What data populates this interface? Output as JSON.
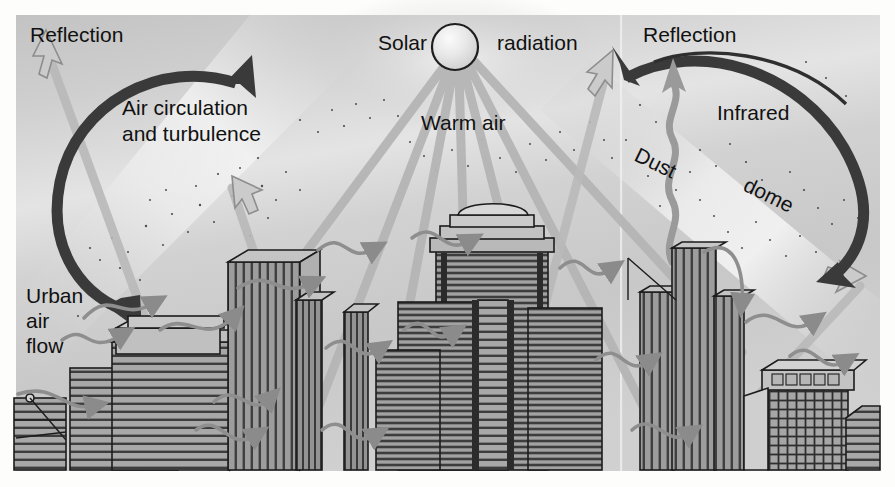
{
  "figure": {
    "background": {
      "panel_fill": "#c9c9c9",
      "panel_highlight": "#e8e8e8",
      "page_fill": "#fdfdfb",
      "panel_x": 16,
      "panel_y": 15,
      "panel_w": 864,
      "panel_h": 456
    },
    "palette": {
      "dark_arrow": "#3a3a3a",
      "mid_gray": "#8e8e8e",
      "light_arrow": "#b4b4b4",
      "building_fill": "#9a9a9a",
      "building_fill_dark": "#7e7e7e",
      "building_fill_light": "#bdbdbd",
      "outline": "#1c1c1c",
      "text": "#111111",
      "sun_fill": "#e9e9e9",
      "seam": "#f2f2f2"
    }
  },
  "labels": [
    {
      "id": "reflection-left",
      "text": "Reflection",
      "x": 30,
      "y": 42,
      "size": 22,
      "rotate": 0
    },
    {
      "id": "air-circulation-1",
      "text": "Air circulation",
      "x": 122,
      "y": 115,
      "size": 21,
      "rotate": 0
    },
    {
      "id": "air-circulation-2",
      "text": "and turbulence",
      "x": 122,
      "y": 141,
      "size": 21,
      "rotate": 0
    },
    {
      "id": "solar",
      "text": "Solar",
      "x": 378,
      "y": 50,
      "size": 21,
      "rotate": 0
    },
    {
      "id": "radiation",
      "text": "radiation",
      "x": 497,
      "y": 50,
      "size": 21,
      "rotate": 0
    },
    {
      "id": "warm-air",
      "text": "Warm air",
      "x": 421,
      "y": 130,
      "size": 21,
      "rotate": 0
    },
    {
      "id": "reflection-right",
      "text": "Reflection",
      "x": 643,
      "y": 42,
      "size": 22,
      "rotate": 0
    },
    {
      "id": "infrared",
      "text": "Infrared",
      "x": 717,
      "y": 120,
      "size": 21,
      "rotate": 0
    },
    {
      "id": "dust",
      "text": "Dust",
      "x": 633,
      "y": 160,
      "size": 21,
      "rotate": 26
    },
    {
      "id": "dome",
      "text": "dome",
      "x": 742,
      "y": 190,
      "size": 21,
      "rotate": 26
    },
    {
      "id": "urban-1",
      "text": "Urban",
      "x": 26,
      "y": 303,
      "size": 21,
      "rotate": 0
    },
    {
      "id": "urban-2",
      "text": "air",
      "x": 26,
      "y": 328,
      "size": 21,
      "rotate": 0
    },
    {
      "id": "urban-3",
      "text": "flow",
      "x": 26,
      "y": 353,
      "size": 21,
      "rotate": 0
    }
  ],
  "sun": {
    "cx": 455,
    "cy": 47,
    "r": 23,
    "ray_count": 7
  },
  "circulation_arrows": [
    {
      "id": "left-circulation",
      "side": "left",
      "cx": 152,
      "cy": 175,
      "rx": 105,
      "ry": 112,
      "color": "#3a3a3a"
    },
    {
      "id": "right-circulation",
      "side": "right",
      "cx": 740,
      "cy": 178,
      "rx": 117,
      "ry": 112,
      "color": "#3a3a3a"
    }
  ],
  "reflection_arrows": [
    {
      "id": "reflection-arrow-left",
      "from_x": 196,
      "from_y": 330,
      "to_x": 42,
      "to_y": 38
    },
    {
      "id": "reflection-arrow-right",
      "from_x": 500,
      "from_y": 330,
      "to_x": 611,
      "to_y": 58
    },
    {
      "id": "infrared-arrow",
      "from_x": 672,
      "from_y": 230,
      "to_x": 672,
      "to_y": 60
    },
    {
      "id": "outgoing-arrow-right",
      "from_x": 740,
      "from_y": 330,
      "to_x": 864,
      "to_y": 268
    }
  ],
  "dust_plume": {
    "id": "dust-plume",
    "x": 672,
    "y_top": 62,
    "y_bottom": 265
  },
  "buildings": [
    {
      "id": "bldg-left-small",
      "x": 14,
      "y": 398,
      "w": 52,
      "h": 72,
      "style": "small-antenna"
    },
    {
      "id": "bldg-left-wide",
      "x": 70,
      "y": 365,
      "w": 108,
      "h": 105,
      "style": "banded-wide"
    },
    {
      "id": "bldg-left-slab",
      "x": 112,
      "y": 342,
      "w": 118,
      "h": 128,
      "style": "banded"
    },
    {
      "id": "bldg-left-tall",
      "x": 116,
      "y": 330,
      "w": 104,
      "h": 140,
      "style": "ribbed"
    },
    {
      "id": "bldg-tower-a",
      "x": 228,
      "y": 262,
      "w": 72,
      "h": 208,
      "style": "ribbed-tall"
    },
    {
      "id": "bldg-tower-b",
      "x": 296,
      "y": 300,
      "w": 26,
      "h": 170,
      "style": "ribbed-thin"
    },
    {
      "id": "bldg-tower-c",
      "x": 340,
      "y": 310,
      "w": 26,
      "h": 160,
      "style": "ribbed-thin"
    },
    {
      "id": "bldg-center-crown",
      "x": 434,
      "y": 212,
      "w": 116,
      "h": 258,
      "style": "crown-tower"
    },
    {
      "id": "bldg-center-left",
      "x": 400,
      "y": 300,
      "w": 76,
      "h": 170,
      "style": "banded"
    },
    {
      "id": "bldg-center-right",
      "x": 528,
      "y": 308,
      "w": 72,
      "h": 162,
      "style": "banded"
    },
    {
      "id": "bldg-center-low",
      "x": 378,
      "y": 348,
      "w": 64,
      "h": 122,
      "style": "banded"
    },
    {
      "id": "bldg-center-spine",
      "x": 478,
      "y": 302,
      "w": 28,
      "h": 168,
      "style": "ribbed-thin"
    },
    {
      "id": "bldg-right-tall",
      "x": 672,
      "y": 248,
      "w": 42,
      "h": 222,
      "style": "ribbed-tall"
    },
    {
      "id": "bldg-right-mid",
      "x": 640,
      "y": 292,
      "w": 32,
      "h": 178,
      "style": "ribbed"
    },
    {
      "id": "bldg-right-stub",
      "x": 714,
      "y": 296,
      "w": 28,
      "h": 174,
      "style": "ribbed"
    },
    {
      "id": "bldg-right-office",
      "x": 768,
      "y": 386,
      "w": 78,
      "h": 84,
      "style": "grid-office"
    },
    {
      "id": "bldg-right-last",
      "x": 852,
      "y": 408,
      "w": 28,
      "h": 62,
      "style": "banded"
    }
  ],
  "wind_swirls": 14
}
